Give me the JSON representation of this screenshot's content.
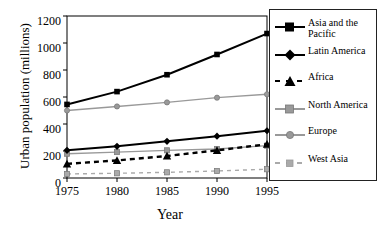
{
  "chart_data": {
    "type": "line",
    "title": "",
    "xlabel": "Year",
    "ylabel": "Urban population (millions)",
    "x": [
      1975,
      1980,
      1985,
      1990,
      1995
    ],
    "xticklabels": [
      "1975",
      "1980",
      "1985",
      "1990",
      "1995"
    ],
    "yticklabels": [
      "0",
      "200",
      "400",
      "600",
      "800",
      "1000",
      "1200"
    ],
    "yticks": [
      0,
      200,
      400,
      600,
      800,
      1000,
      1200
    ],
    "ylim": [
      0,
      1200
    ],
    "xlim": [
      1975,
      1995
    ],
    "grid": false,
    "legend_position": "right",
    "series": [
      {
        "name": "Asia and the Pacific",
        "values": [
          545,
          640,
          765,
          915,
          1070
        ],
        "color": "#000000",
        "marker": "square",
        "linestyle": "solid"
      },
      {
        "name": "Latin America",
        "values": [
          205,
          235,
          272,
          310,
          350
        ],
        "color": "#000000",
        "marker": "diamond",
        "linestyle": "solid"
      },
      {
        "name": "Africa",
        "values": [
          105,
          130,
          163,
          205,
          250
        ],
        "color": "#000000",
        "marker": "triangle",
        "linestyle": "dashed"
      },
      {
        "name": "North America",
        "values": [
          180,
          192,
          205,
          215,
          240
        ],
        "color": "#999999",
        "marker": "square",
        "linestyle": "solid"
      },
      {
        "name": "Europe",
        "values": [
          500,
          530,
          560,
          595,
          620
        ],
        "color": "#999999",
        "marker": "circle",
        "linestyle": "solid"
      },
      {
        "name": "West Asia",
        "values": [
          30,
          35,
          42,
          52,
          65
        ],
        "color": "#aaaaaa",
        "marker": "square",
        "linestyle": "dashed"
      }
    ]
  },
  "legend": {
    "items": [
      {
        "label_line1": "Asia and the",
        "label_line2": "Pacific"
      },
      {
        "label_line1": "Latin America",
        "label_line2": ""
      },
      {
        "label_line1": "Africa",
        "label_line2": ""
      },
      {
        "label_line1": "North America",
        "label_line2": ""
      },
      {
        "label_line1": "Europe",
        "label_line2": ""
      },
      {
        "label_line1": "West Asia",
        "label_line2": ""
      }
    ]
  }
}
